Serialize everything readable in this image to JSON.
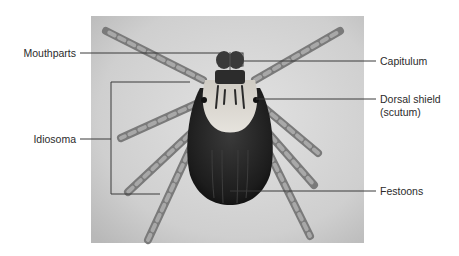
{
  "figure": {
    "photo": {
      "background_color": "#c9c9c9",
      "body_color": "#1e1e1e",
      "scutum_color": "#d8d5cf",
      "leg_color": "#8a8a8a"
    },
    "line_color": "#3a3a3a",
    "labels": {
      "mouthparts": "Mouthparts",
      "capitulum": "Capitulum",
      "dorsal_shield_line1": "Dorsal shield",
      "dorsal_shield_line2": "(scutum)",
      "idiosoma": "Idiosoma",
      "festoons": "Festoons"
    }
  }
}
